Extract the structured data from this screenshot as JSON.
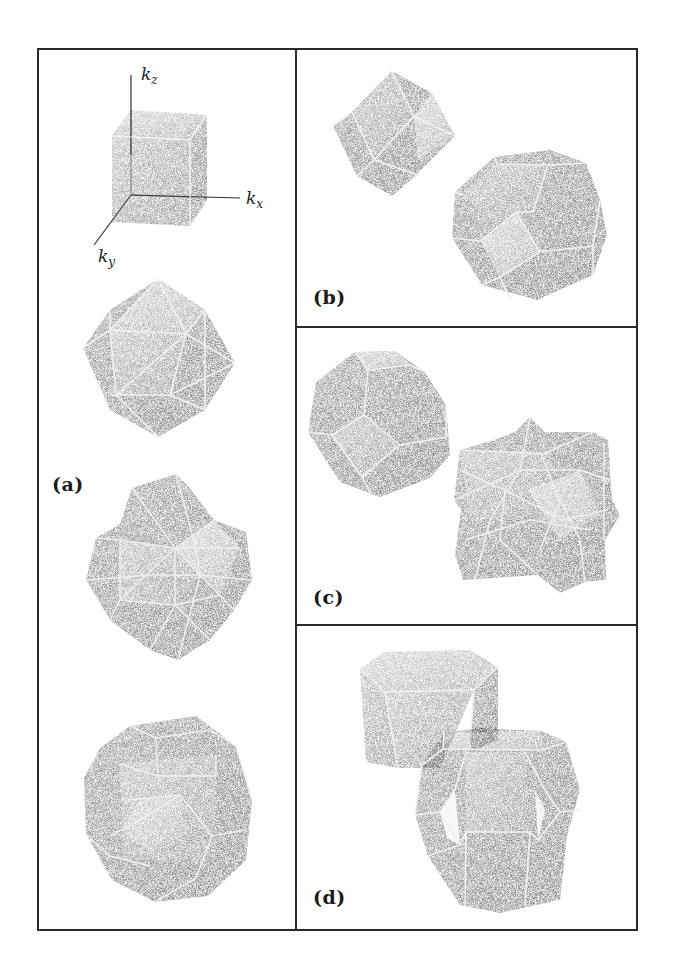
{
  "figure": {
    "panels": [
      {
        "id": "a",
        "label": "(a)",
        "shapes": [
          "cube-with-axes",
          "cuboctahedron-stellation",
          "stellated-polyhedron",
          "truncated-polyhedron"
        ]
      },
      {
        "id": "b",
        "label": "(b)",
        "shapes": [
          "rhombic-dodecahedron",
          "truncated-octahedron"
        ]
      },
      {
        "id": "c",
        "label": "(c)",
        "shapes": [
          "truncated-octahedron",
          "stellated-cube-compound"
        ]
      },
      {
        "id": "d",
        "label": "(d)",
        "shapes": [
          "hexagonal-prism",
          "hexagonal-second-zone"
        ]
      }
    ],
    "axes": {
      "kz": {
        "base": "k",
        "sub": "z"
      },
      "kx": {
        "base": "k",
        "sub": "x"
      },
      "ky": {
        "base": "k",
        "sub": "y"
      }
    }
  },
  "colors": {
    "frame": "#2a2a2a",
    "face_dark": "#3c3c3c",
    "face_mid": "#6a6a6a",
    "face_light": "#9a9a9a",
    "edge": "#f4f4f4",
    "background": "#ffffff"
  }
}
